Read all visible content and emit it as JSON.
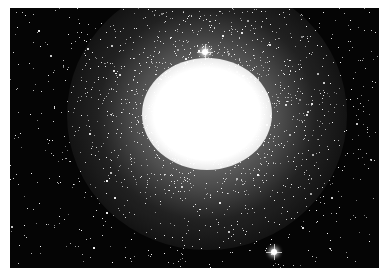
{
  "image": {
    "subject": "globular star cluster",
    "description": "Dense spherical cluster of stars with a saturated white core on a black starfield",
    "colors": {
      "background": "#050505",
      "core": "#ffffff",
      "frame": "#ffffff"
    },
    "features": {
      "core_center": [
        207,
        108
      ],
      "bright_stars": [
        {
          "name": "star-above-core",
          "x": 205,
          "y": 52
        },
        {
          "name": "star-bottom-right",
          "x": 274,
          "y": 252
        }
      ]
    }
  }
}
